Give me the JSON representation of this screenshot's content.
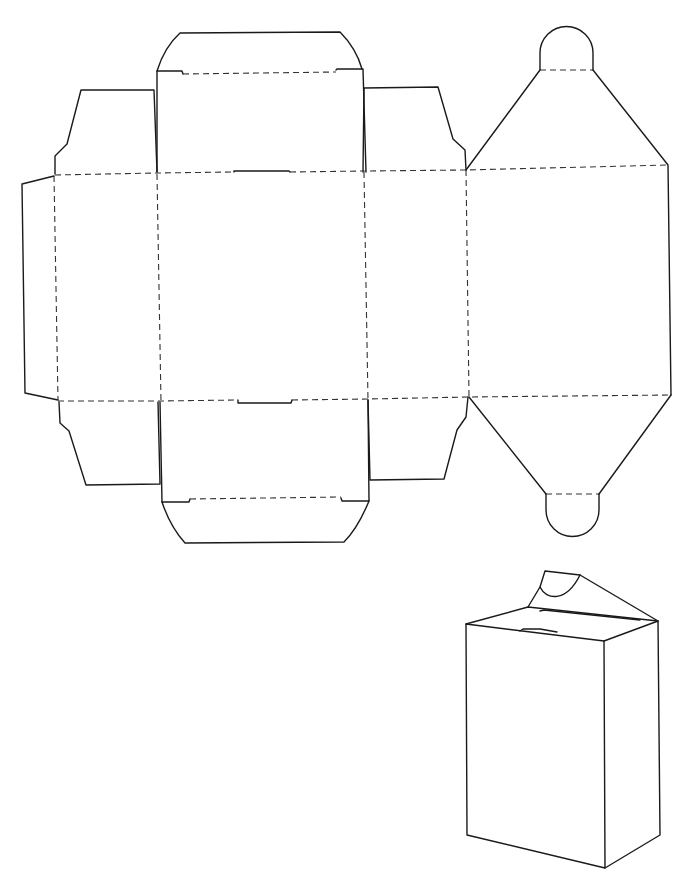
{
  "diagram": {
    "type": "box-dieline",
    "colors": {
      "background": "#ffffff",
      "cut_line": "#1a1a1a",
      "fold_line": "#333333"
    },
    "legend": {
      "cut_line_style": "solid",
      "fold_line_style": "dashed"
    },
    "net": {
      "panels": [
        {
          "id": "glue-flap",
          "label": ""
        },
        {
          "id": "side-panel-left",
          "label": ""
        },
        {
          "id": "front-panel",
          "label": ""
        },
        {
          "id": "side-panel-right",
          "label": ""
        },
        {
          "id": "back-panel",
          "label": ""
        }
      ],
      "top_flaps": [
        "dust-flap-left-top",
        "tuck-flap-top",
        "dust-flap-right-top",
        "gable-top-with-round-tab"
      ],
      "bottom_flaps": [
        "dust-flap-left-bottom",
        "tuck-flap-bottom",
        "dust-flap-right-bottom",
        "gable-bottom-with-round-tab"
      ]
    },
    "assembled_view": {
      "label": "",
      "shape": "rectangular box with sloped gable top and round tab"
    }
  }
}
